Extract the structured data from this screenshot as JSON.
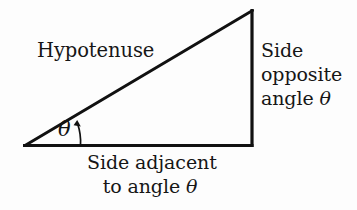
{
  "figure": {
    "background_color": "#fdfdfd",
    "stroke_color": "#111111",
    "text_color": "#161616"
  },
  "labels": {
    "hypotenuse": "Hypotenuse",
    "opposite_line1": "Side",
    "opposite_line2": "opposite",
    "opposite_line3_prefix": "angle ",
    "opposite_line3_symbol": "θ",
    "adjacent_line1": "Side adjacent",
    "adjacent_line2_prefix": "to angle ",
    "adjacent_line2_symbol": "θ",
    "angle_symbol": "θ"
  },
  "geometry": {
    "vertex_left": "24,146",
    "vertex_bottom_right": "252,146",
    "vertex_top_right": "252,10",
    "line_width": "3",
    "arc_line_width": "1.6"
  }
}
